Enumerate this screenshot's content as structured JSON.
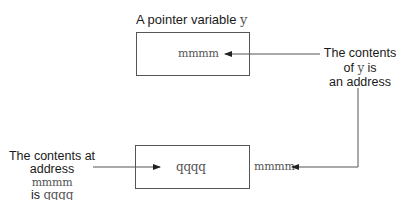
{
  "diagram": {
    "title_prefix": "A pointer variable ",
    "title_var": "y",
    "pointer_box": {
      "value": "mmmm"
    },
    "pointer_note": {
      "line1": "The contents",
      "line2_prefix": "of ",
      "line2_var": "y",
      "line2_suffix": " is",
      "line3": "an address"
    },
    "target_box": {
      "value": "qqqq",
      "address": "mmmm"
    },
    "target_note": {
      "line1": "The contents at",
      "line2_prefix": "address ",
      "line2_code": "mmmm",
      "line3_prefix": "is ",
      "line3_code": "qqqq"
    },
    "colors": {
      "stroke": "#555555",
      "text": "#1a1a1a"
    }
  }
}
